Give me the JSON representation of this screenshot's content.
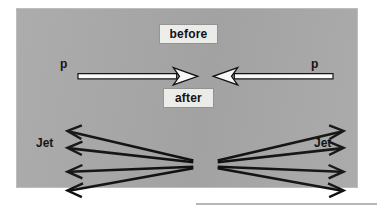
{
  "figure": {
    "kind": "physics-collision-diagram",
    "panel_background_color": "#a8a8a8",
    "ink_color": "#0d0d0d",
    "chip_background_color": "#f3f3f0",
    "captions": {
      "before": "before",
      "after": "after"
    },
    "before_row": {
      "left_particle_label": "p",
      "right_particle_label": "p",
      "description": "two hollow white arrows pointing toward each other"
    },
    "after_row": {
      "left_jet_label": "Jet",
      "right_jet_label": "Jet",
      "left_arrow_count": 4,
      "right_arrow_count": 4,
      "description": "two fans of four solid arrows diverging outward from the collision point"
    }
  }
}
